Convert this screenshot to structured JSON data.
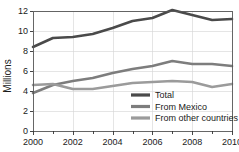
{
  "chart_data": {
    "type": "line",
    "title": "",
    "xlabel": "",
    "ylabel": "Millions",
    "x": [
      2000,
      2001,
      2002,
      2003,
      2004,
      2005,
      2006,
      2007,
      2008,
      2009,
      2010
    ],
    "xlim": [
      2000,
      2010
    ],
    "ylim": [
      0,
      12
    ],
    "xtick_labels": [
      "2000",
      "2002",
      "2004",
      "2006",
      "2008",
      "2010"
    ],
    "xtick_values": [
      2000,
      2002,
      2004,
      2006,
      2008,
      2010
    ],
    "ytick_labels": [
      "0",
      "2",
      "4",
      "6",
      "8",
      "10",
      "12"
    ],
    "ytick_values": [
      0,
      2,
      4,
      6,
      8,
      10,
      12
    ],
    "grid": true,
    "legend_position": "inside-bottom-right",
    "series": [
      {
        "name": "Total",
        "color": "#4a4a4a",
        "values": [
          8.4,
          9.3,
          9.4,
          9.7,
          10.3,
          11.0,
          11.3,
          12.1,
          11.6,
          11.1,
          11.2
        ]
      },
      {
        "name": "From Mexico",
        "color": "#7d7d7d",
        "values": [
          3.8,
          4.6,
          5.0,
          5.3,
          5.8,
          6.2,
          6.5,
          7.0,
          6.7,
          6.7,
          6.5
        ]
      },
      {
        "name": "From other countries",
        "color": "#9b9b9b",
        "values": [
          4.6,
          4.7,
          4.2,
          4.2,
          4.5,
          4.8,
          4.9,
          5.0,
          4.9,
          4.4,
          4.7
        ]
      }
    ]
  },
  "axis": {
    "ylabel": "Millions"
  },
  "legend": {
    "items": [
      {
        "label": "Total"
      },
      {
        "label": "From Mexico"
      },
      {
        "label": "From other countries"
      }
    ]
  }
}
